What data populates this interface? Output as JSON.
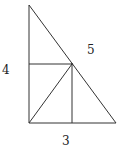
{
  "diagram": {
    "labels": {
      "left_leg": "4",
      "hypotenuse": "5",
      "bottom_leg": "3"
    },
    "colors": {
      "stroke": "#333333",
      "text": "#222222",
      "background": "#ffffff"
    }
  }
}
